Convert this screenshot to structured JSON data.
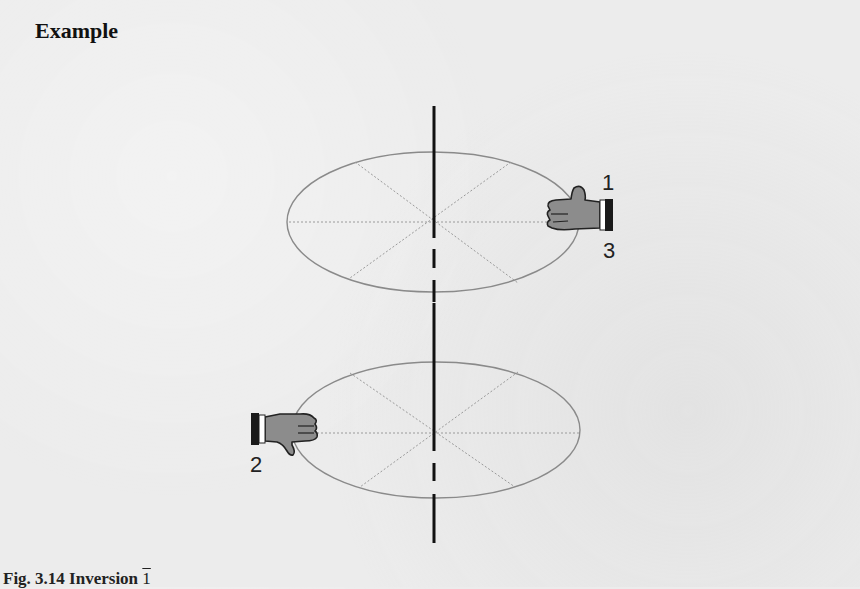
{
  "heading": "Example",
  "caption": {
    "figure_label": "Fig. 3.14",
    "title": "Inversion",
    "symbol": "1"
  },
  "diagram": {
    "type": "symmetry-operation",
    "operation": "inversion",
    "axis": {
      "style": "vertical black line, dashed where behind planes"
    },
    "planes": [
      {
        "name": "upper-disc",
        "center": [
          433,
          222
        ],
        "rx": 146,
        "ry": 70,
        "divisions": 8
      },
      {
        "name": "lower-disc",
        "center": [
          436,
          430
        ],
        "rx": 144,
        "ry": 68,
        "divisions": 8
      }
    ],
    "objects": [
      {
        "name": "right-hand-upper",
        "labels": [
          "1",
          "3"
        ],
        "position": "right edge of upper disc",
        "pointing": "left, thumb up"
      },
      {
        "name": "hand-lower",
        "labels": [
          "2"
        ],
        "position": "left edge of lower disc",
        "pointing": "right, thumb down"
      }
    ],
    "labels": {
      "one": "1",
      "two": "2",
      "three": "3"
    },
    "colors": {
      "axis": "#111111",
      "ellipse": "#8a8a8a",
      "hand_fill": "#8c8c8c",
      "cuff": "#1a1a1a",
      "background": "#ececec"
    }
  }
}
